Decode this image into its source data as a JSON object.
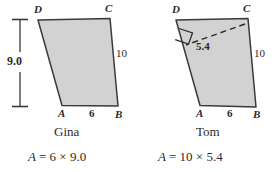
{
  "figure": {
    "background_color": "#ffffff",
    "fill_color": "#d2d2d2",
    "stroke_color": "#3a3a3a"
  },
  "panels": [
    {
      "id": "gina",
      "person_label": "Gina",
      "formula": {
        "variable": "A",
        "equals": "=",
        "first": "6",
        "times": "×",
        "second": "9.0",
        "full_text": "A = 6 × 9.0"
      },
      "vertices": {
        "top_left": "D",
        "top_right": "C",
        "bottom_left": "A",
        "bottom_right": "B"
      },
      "measures": {
        "height": "9.0",
        "slant_side": "10",
        "base": "6"
      },
      "has_height_dimension_line": true,
      "has_altitude": false
    },
    {
      "id": "tom",
      "person_label": "Tom",
      "formula": {
        "variable": "A",
        "equals": "=",
        "first": "10",
        "times": "×",
        "second": "5.4",
        "full_text": "A = 10 × 5.4"
      },
      "vertices": {
        "top_left": "D",
        "top_right": "C",
        "bottom_left": "A",
        "bottom_right": "B"
      },
      "measures": {
        "altitude": "5.4",
        "slant_side": "10",
        "base": "6"
      },
      "has_height_dimension_line": false,
      "has_altitude": true,
      "altitude_right_angle_marker": true
    }
  ]
}
